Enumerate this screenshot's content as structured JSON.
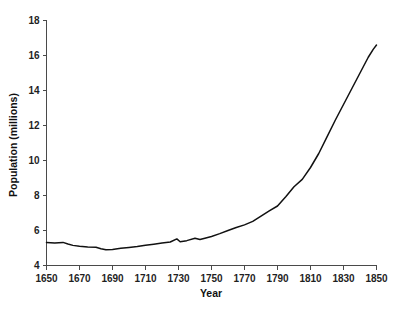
{
  "chart_data": {
    "type": "line",
    "title": "",
    "subtitle": "",
    "xlabel": "Year",
    "ylabel": "Population (millions)",
    "xlim": [
      1650,
      1850
    ],
    "ylim": [
      4,
      18
    ],
    "grid": false,
    "legend": false,
    "legend_position": "none",
    "line_color": "#111111",
    "background_color": "#ffffff",
    "xticks": [
      1650,
      1670,
      1690,
      1710,
      1730,
      1750,
      1770,
      1790,
      1810,
      1830,
      1850
    ],
    "xtick_labels": [
      "1650",
      "1670",
      "1690",
      "1710",
      "1730",
      "1750",
      "1770",
      "1790",
      "1810",
      "1830",
      "1850"
    ],
    "yticks": [
      4,
      6,
      8,
      10,
      12,
      14,
      16,
      18
    ],
    "ytick_labels": [
      "4",
      "6",
      "8",
      "10",
      "12",
      "14",
      "16",
      "18"
    ],
    "series": [
      {
        "name": "Population",
        "x": [
          1650,
          1655,
          1660,
          1663,
          1666,
          1670,
          1675,
          1680,
          1683,
          1686,
          1690,
          1695,
          1700,
          1705,
          1710,
          1715,
          1720,
          1725,
          1729,
          1731,
          1735,
          1740,
          1743,
          1746,
          1750,
          1755,
          1760,
          1765,
          1770,
          1775,
          1780,
          1785,
          1790,
          1795,
          1800,
          1805,
          1810,
          1815,
          1820,
          1825,
          1830,
          1835,
          1840,
          1845,
          1848,
          1850
        ],
        "y": [
          5.31,
          5.28,
          5.32,
          5.23,
          5.15,
          5.1,
          5.06,
          5.04,
          4.96,
          4.9,
          4.92,
          4.98,
          5.03,
          5.08,
          5.16,
          5.22,
          5.28,
          5.34,
          5.52,
          5.36,
          5.42,
          5.56,
          5.49,
          5.56,
          5.66,
          5.82,
          6.0,
          6.17,
          6.32,
          6.52,
          6.82,
          7.12,
          7.4,
          7.93,
          8.5,
          8.92,
          9.6,
          10.4,
          11.35,
          12.3,
          13.2,
          14.1,
          15.0,
          15.9,
          16.35,
          16.6
        ]
      }
    ],
    "annotations": {
      "start_value": 5.31,
      "minimum_value": 4.9,
      "minimum_year": 1686,
      "peak_value": 16.6,
      "peak_year": 1850,
      "local_spike_year": 1729,
      "local_spike_value": 5.52
    }
  }
}
